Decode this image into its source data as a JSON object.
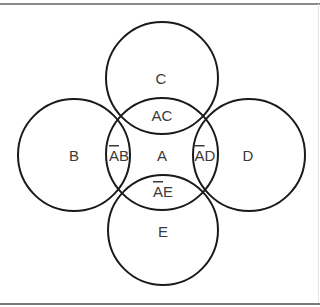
{
  "diagram": {
    "type": "venn",
    "colors": {
      "stroke": "#1a1a1a",
      "label": "#3a3a3a",
      "rule": "#8a8a8a"
    },
    "circles": [
      {
        "id": "A",
        "cx": 162,
        "cy": 154,
        "r": 56
      },
      {
        "id": "B",
        "cx": 74,
        "cy": 155,
        "r": 56
      },
      {
        "id": "C",
        "cx": 162,
        "cy": 78,
        "r": 56
      },
      {
        "id": "D",
        "cx": 249,
        "cy": 155,
        "r": 56
      },
      {
        "id": "E",
        "cx": 163,
        "cy": 230,
        "r": 55
      }
    ],
    "labels": {
      "A": "A",
      "B": "B",
      "C": "C",
      "D": "D",
      "E": "E",
      "AC": "AC",
      "AB_bar": "A",
      "AB_rest": "B",
      "AD_bar": "A",
      "AD_rest": "D",
      "AE_bar": "A",
      "AE_rest": "E"
    },
    "regions": [
      {
        "name": "C",
        "text": "C",
        "overline": ""
      },
      {
        "name": "AC",
        "text": "AC",
        "overline": ""
      },
      {
        "name": "B",
        "text": "B",
        "overline": ""
      },
      {
        "name": "ĀB",
        "text": "AB",
        "overline": "A"
      },
      {
        "name": "A",
        "text": "A",
        "overline": ""
      },
      {
        "name": "ĀD",
        "text": "AD",
        "overline": "A"
      },
      {
        "name": "D",
        "text": "D",
        "overline": ""
      },
      {
        "name": "ĀE",
        "text": "AE",
        "overline": "A"
      },
      {
        "name": "E",
        "text": "E",
        "overline": ""
      }
    ]
  }
}
